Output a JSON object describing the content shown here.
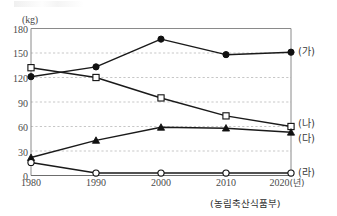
{
  "chart_data": {
    "type": "line",
    "title": "",
    "xlabel": "(년)",
    "ylabel": "(kg)",
    "unit_label": "(kg)",
    "year_suffix": "(년)",
    "source": "(농림축산식품부)",
    "categories": [
      "1980",
      "1990",
      "2000",
      "2010",
      "2020"
    ],
    "xlim": [
      1980,
      2020
    ],
    "ylim": [
      0,
      180
    ],
    "yticks": [
      0,
      30,
      60,
      90,
      120,
      150,
      180
    ],
    "grid": true,
    "legend_position": "right-of-plot",
    "series": [
      {
        "name": "(가)",
        "marker": "filled-circle",
        "values": [
          121,
          133,
          167,
          148,
          151
        ]
      },
      {
        "name": "(나)",
        "marker": "open-square",
        "values": [
          132,
          120,
          95,
          73,
          60
        ]
      },
      {
        "name": "(다)",
        "marker": "filled-triangle",
        "values": [
          22,
          43,
          59,
          58,
          53
        ]
      },
      {
        "name": "(라)",
        "marker": "open-circle",
        "values": [
          16,
          3,
          3,
          3,
          3
        ]
      }
    ]
  },
  "axis": {
    "unit": "(kg)",
    "ytick_labels": [
      "180",
      "150",
      "120",
      "90",
      "60",
      "30",
      "0"
    ],
    "xtick_labels": [
      "1980",
      "1990",
      "2000",
      "2010",
      "2020"
    ]
  },
  "legend": {
    "items": [
      {
        "label": "(가)"
      },
      {
        "label": "(나)"
      },
      {
        "label": "(다)"
      },
      {
        "label": "(라)"
      }
    ]
  },
  "colors": {
    "line": "#1a1a1a",
    "grid": "#b9b9b9",
    "axis": "#8a8a8a",
    "text": "#3a3a3a",
    "background": "#ffffff"
  }
}
